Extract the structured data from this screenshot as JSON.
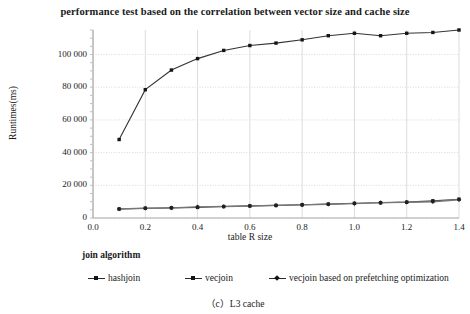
{
  "chart_data": {
    "type": "line",
    "title": "performance test based on the correlation between vector size and cache size",
    "caption": "（c）L3 cache",
    "xlabel": "table R size",
    "ylabel": "Runtimes(ms)",
    "xlim": [
      0.0,
      1.4
    ],
    "ylim": [
      0,
      115000
    ],
    "xticks": [
      "0.0",
      "0.2",
      "0.4",
      "0.6",
      "0.8",
      "1.0",
      "1.2",
      "1.4"
    ],
    "xtick_values": [
      0.0,
      0.2,
      0.4,
      0.6,
      0.8,
      1.0,
      1.2,
      1.4
    ],
    "yticks": [
      "0",
      "20 000",
      "40 000",
      "60 000",
      "80 000",
      "100 000"
    ],
    "ytick_values": [
      0,
      20000,
      40000,
      60000,
      80000,
      100000
    ],
    "grid": true,
    "legend_title": "join algorithm",
    "legend_position": "below-left",
    "x": [
      0.1,
      0.2,
      0.3,
      0.4,
      0.5,
      0.6,
      0.7,
      0.8,
      0.9,
      1.0,
      1.1,
      1.2,
      1.3,
      1.4
    ],
    "series": [
      {
        "name": "hashjoin",
        "marker": "square",
        "color": "#333333",
        "values": [
          48000,
          78500,
          90500,
          97500,
          102500,
          105500,
          107000,
          109000,
          111500,
          113000,
          111500,
          113000,
          113500,
          115000
        ]
      },
      {
        "name": "vecjoin",
        "marker": "square",
        "color": "#444444",
        "values": [
          5500,
          6000,
          6200,
          6500,
          7000,
          7400,
          7700,
          8100,
          8500,
          9000,
          9300,
          9700,
          10500,
          11500
        ]
      },
      {
        "name": "vecjoin based on prefetching optimization",
        "marker": "diamond",
        "color": "#777777",
        "values": [
          5500,
          6000,
          6200,
          6800,
          7000,
          7300,
          7700,
          8000,
          8400,
          8800,
          9400,
          9600,
          9900,
          11200
        ]
      }
    ]
  },
  "colors": {
    "axis": "#aaaaaa",
    "grid": "#d8d8d8",
    "text": "#1a1a1a"
  }
}
